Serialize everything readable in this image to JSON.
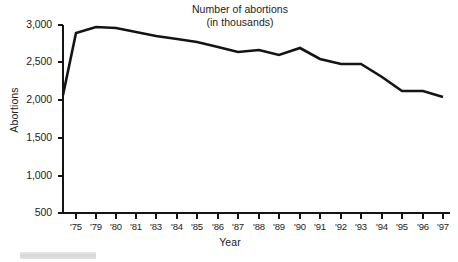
{
  "figure": {
    "name": "number-of-abortions-line-chart",
    "background_color": "#ffffff",
    "ink_color": "#141414"
  },
  "title": {
    "line1": "Number of abortions",
    "line2": "(in thousands)"
  },
  "axes": {
    "x_title": "Year",
    "y_title": "Abortions"
  },
  "artifact": {
    "name": "scan-smudge",
    "color": "#d6d6d6"
  },
  "chart_data": {
    "type": "line",
    "title": "Number of abortions (in thousands)",
    "xlabel": "Year",
    "ylabel": "Abortions",
    "ylim": [
      500,
      3000
    ],
    "ytick_values": [
      500,
      1000,
      1500,
      2000,
      2500,
      3000
    ],
    "ytick_labels": [
      "500",
      "1,000",
      "1,500",
      "2,000",
      "2,500",
      "3,000"
    ],
    "grid": false,
    "legend": "none",
    "line_color": "#141414",
    "line_width_px": 2.6,
    "xtick_labels": [
      "'75",
      "'79",
      "'80",
      "'81",
      "'83",
      "'84",
      "'85",
      "'86",
      "'87",
      "'88",
      "'89",
      "'90",
      "'91",
      "'92",
      "'93",
      "'94",
      "'95",
      "'96",
      "'97"
    ],
    "categories": [
      "",
      "'75",
      "'79",
      "'80",
      "'81",
      "'83",
      "'84",
      "'85",
      "'86",
      "'87",
      "'88",
      "'89",
      "'90",
      "'91",
      "'92",
      "'93",
      "'94",
      "'95",
      "'96",
      "'97"
    ],
    "values": [
      2090,
      2880,
      2940,
      2930,
      2880,
      2830,
      2800,
      2770,
      2720,
      2660,
      2680,
      2620,
      2690,
      2570,
      2520,
      2510,
      2350,
      2170,
      2170,
      2090
    ],
    "points_px": [
      {
        "x": 63,
        "y": 95
      },
      {
        "x": 76,
        "y": 33
      },
      {
        "x": 96,
        "y": 27
      },
      {
        "x": 116,
        "y": 28
      },
      {
        "x": 136,
        "y": 32
      },
      {
        "x": 156,
        "y": 36
      },
      {
        "x": 177,
        "y": 39
      },
      {
        "x": 197,
        "y": 42
      },
      {
        "x": 218,
        "y": 47
      },
      {
        "x": 238,
        "y": 52
      },
      {
        "x": 259,
        "y": 50
      },
      {
        "x": 279,
        "y": 55
      },
      {
        "x": 300,
        "y": 48
      },
      {
        "x": 320,
        "y": 59
      },
      {
        "x": 341,
        "y": 64
      },
      {
        "x": 361,
        "y": 64
      },
      {
        "x": 382,
        "y": 77
      },
      {
        "x": 402,
        "y": 91
      },
      {
        "x": 423,
        "y": 91
      },
      {
        "x": 443,
        "y": 97
      }
    ],
    "x_axis_px": {
      "left": 63,
      "right": 450,
      "y": 213
    },
    "y_axis_px": {
      "x": 63,
      "top": 25,
      "bottom": 213
    },
    "ytick_px": [
      {
        "label": "3,000",
        "y": 25
      },
      {
        "label": "2,500",
        "y": 62
      },
      {
        "label": "2,000",
        "y": 100
      },
      {
        "label": "1,500",
        "y": 138
      },
      {
        "label": "1,000",
        "y": 176
      },
      {
        "label": "500",
        "y": 213
      }
    ],
    "xtick_px": [
      76,
      96,
      116,
      136,
      156,
      177,
      197,
      218,
      238,
      259,
      279,
      300,
      320,
      341,
      361,
      382,
      402,
      423,
      443
    ]
  }
}
